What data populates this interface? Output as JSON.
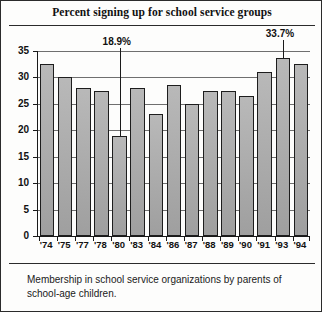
{
  "chart_data": {
    "type": "bar",
    "title": "Percent signing up for school service groups",
    "xlabel": "",
    "ylabel": "",
    "ylim": [
      0,
      35
    ],
    "yticks": [
      0,
      5,
      10,
      15,
      20,
      25,
      30,
      35
    ],
    "ytick_labels": [
      "0",
      "5",
      "10",
      "15",
      "20",
      "25",
      "30",
      "35"
    ],
    "grid": true,
    "grid_axis": "y",
    "legend": null,
    "categories": [
      "'74",
      "'75",
      "'77",
      "'78",
      "'80",
      "'83",
      "'84",
      "'86",
      "'87",
      "'88",
      "'89",
      "'90",
      "'91",
      "'93",
      "'94"
    ],
    "values": [
      32.5,
      30.0,
      28.0,
      27.5,
      18.9,
      28.0,
      23.0,
      28.5,
      25.0,
      27.5,
      27.5,
      26.5,
      31.0,
      33.7,
      32.5
    ],
    "annotations": [
      {
        "label": "18.9%",
        "category": "'80",
        "value": 18.9
      },
      {
        "label": "33.7%",
        "category": "'93",
        "value": 33.7
      }
    ],
    "bar_fill": "#a9a9a9",
    "bar_edge": "#1d1d1d"
  },
  "caption": {
    "text": "Membership in school service organizations by parents of school-age children."
  }
}
